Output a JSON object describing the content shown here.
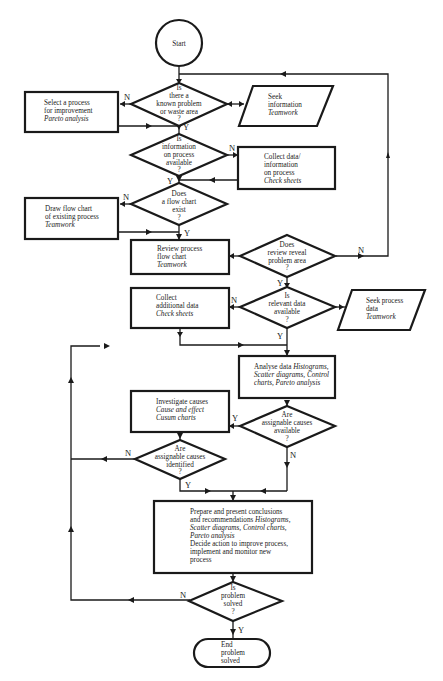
{
  "diagram": {
    "type": "flowchart",
    "start": {
      "label": "Start"
    },
    "end": {
      "lines": [
        "End",
        "problem",
        "solved"
      ]
    },
    "decisions": [
      {
        "id": "d1",
        "lines": [
          "Is",
          "there a",
          "known problem",
          "or waste area",
          "?"
        ],
        "yes": "Y",
        "no": "N"
      },
      {
        "id": "d2",
        "lines": [
          "Is",
          "information",
          "on process",
          "available",
          "?"
        ],
        "yes": "Y",
        "no": "N"
      },
      {
        "id": "d3",
        "lines": [
          "Does",
          "a flow chart",
          "exist",
          "?"
        ],
        "yes": "Y",
        "no": "N"
      },
      {
        "id": "d4",
        "lines": [
          "Does",
          "review reveal",
          "problem area",
          "?"
        ],
        "yes": "Y",
        "no": "N"
      },
      {
        "id": "d5",
        "lines": [
          "Is",
          "relevant data",
          "available",
          "?"
        ],
        "yes": "Y",
        "no": "N"
      },
      {
        "id": "d6",
        "lines": [
          "Are",
          "assignable causes",
          "available",
          "?"
        ],
        "yes": "Y",
        "no": "N"
      },
      {
        "id": "d7",
        "lines": [
          "Are",
          "assignable causes",
          "identified",
          "?"
        ],
        "yes": "Y",
        "no": "N"
      },
      {
        "id": "d8",
        "lines": [
          "Is",
          "problem",
          "solved",
          "?"
        ],
        "yes": "Y",
        "no": "N"
      }
    ],
    "processes": [
      {
        "id": "p1",
        "lines": [
          "Select a process",
          "for improvement"
        ],
        "tool": "Pareto analysis"
      },
      {
        "id": "p2",
        "lines": [
          "Collect data/",
          "information",
          "on process"
        ],
        "tool": "Check sheets"
      },
      {
        "id": "p3",
        "lines": [
          "Draw flow chart",
          "of existing process"
        ],
        "tool": "Teamwork"
      },
      {
        "id": "p4",
        "lines": [
          "Review process",
          "flow chart"
        ],
        "tool": "Teamwork"
      },
      {
        "id": "p5",
        "lines": [
          "Collect",
          "additional data"
        ],
        "tool": "Check sheets"
      },
      {
        "id": "p6",
        "text": "Analyse data",
        "tool_lines": [
          "Histograms,",
          "Scatter diagrams, Control",
          "charts, Pareto analysis"
        ]
      },
      {
        "id": "p7",
        "lines": [
          "Investigate causes"
        ],
        "tool_lines": [
          "Cause and effect",
          "Cusum charts"
        ]
      },
      {
        "id": "p8",
        "lines": [
          "Prepare and present conclusions",
          "and recommendations"
        ],
        "tool_lines": [
          "Histograms,",
          "Scatter diagrams, Control charts,",
          "Pareto analysis"
        ],
        "lines_after": [
          "Decide action to improve process,",
          "implement and monitor new",
          "process"
        ]
      }
    ],
    "inputs": [
      {
        "id": "io1",
        "lines": [
          "Seek",
          "information"
        ],
        "tool": "Teamwork"
      },
      {
        "id": "io2",
        "lines": [
          "Seek process",
          "data"
        ],
        "tool": "Teamwork"
      }
    ]
  },
  "colors": {
    "stroke": "#1a1a1a",
    "background": "#ffffff"
  }
}
